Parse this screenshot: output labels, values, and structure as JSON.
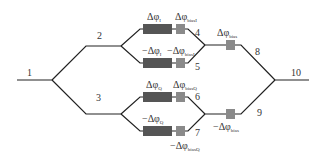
{
  "diagram": {
    "type": "dual-parallel Mach-Zehnder modulator (IQ modulator) schematic",
    "colors": {
      "waveguide": "#222222",
      "main_electrode": "#555555",
      "bias_electrode": "#8a8a8a",
      "text": "#333333",
      "background": "#ffffff"
    },
    "port_labels": {
      "p1": "1",
      "p2": "2",
      "p3": "3",
      "p4": "4",
      "p5": "5",
      "p6": "6",
      "p7": "7",
      "p8": "8",
      "p9": "9",
      "p10": "10"
    },
    "phase_labels": {
      "arm4_main": {
        "prefix": "Δφ",
        "sub": "I"
      },
      "arm4_bias": {
        "prefix": "Δφ",
        "sub": "biasI"
      },
      "arm5_main": {
        "prefix": "−Δφ",
        "sub": "I"
      },
      "arm5_bias": {
        "prefix": "−Δφ",
        "sub": "biasI"
      },
      "arm6_main": {
        "prefix": "Δφ",
        "sub": "Q"
      },
      "arm6_bias": {
        "prefix": "Δφ",
        "sub": "biasQ"
      },
      "arm7_main": {
        "prefix": "−Δφ",
        "sub": "Q"
      },
      "arm7_bias": {
        "prefix": "−Δφ",
        "sub": "biasQ"
      },
      "arm8_bias": {
        "prefix": "Δφ",
        "sub": "bias"
      },
      "arm9_bias": {
        "prefix": "−Δφ",
        "sub": "bias"
      }
    }
  }
}
